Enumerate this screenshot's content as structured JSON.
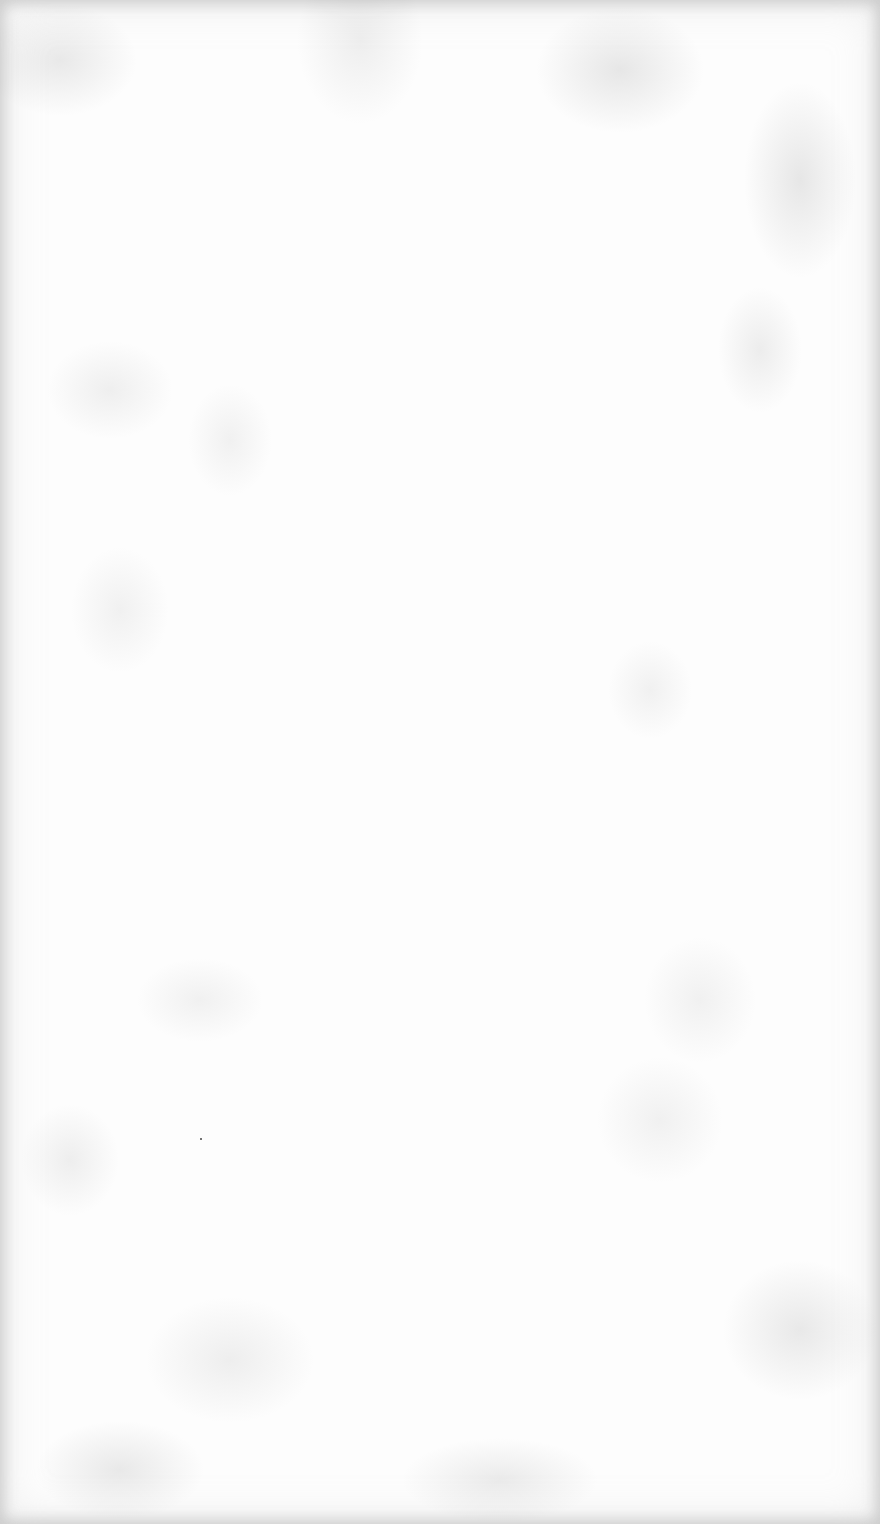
{
  "document": {
    "type": "blank-page",
    "background_color": "#fdfdfd",
    "texture": "mottled-paper",
    "text_content": ""
  }
}
